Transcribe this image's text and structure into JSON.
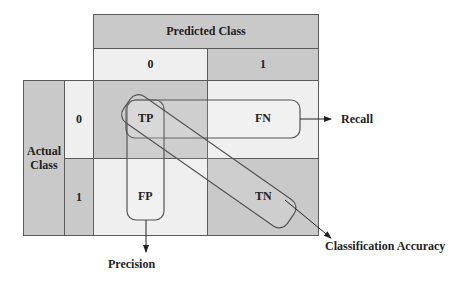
{
  "diagram": {
    "predicted_header": "Predicted Class",
    "actual_header": "Actual Class",
    "predicted_labels": [
      "0",
      "1"
    ],
    "actual_labels": [
      "0",
      "1"
    ],
    "cells": {
      "tp": "TP",
      "fn": "FN",
      "fp": "FP",
      "tn": "TN"
    },
    "metrics": {
      "recall": "Recall",
      "precision": "Precision",
      "accuracy": "Classification Accuracy"
    },
    "colors": {
      "dark_fill": "#c9c9c9",
      "light_fill": "#efefef",
      "line": "#5a5a5a"
    }
  }
}
